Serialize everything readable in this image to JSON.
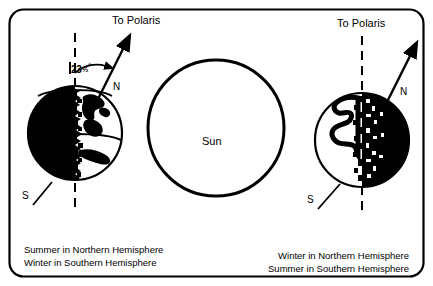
{
  "figure": {
    "kind": "earth-seasons-diagram",
    "background_color": "#ffffff",
    "ink_color": "#000000",
    "border": {
      "name": "rounded-frame",
      "stroke_width": 2,
      "corner_radius": 14
    }
  },
  "sun": {
    "label": "Sun",
    "center_x": 216,
    "center_y": 128,
    "radius": 68,
    "fill": "#ffffff",
    "stroke": "#000000",
    "stroke_width": 3
  },
  "left_earth": {
    "name": "earth-summer-north",
    "center_x": 75,
    "center_y": 133,
    "radius": 47,
    "night_side": "left",
    "polaris_label": "To Polaris",
    "axis_tilt_label_value": "23",
    "axis_tilt_label_fraction": "1/2",
    "axis_tilt_label_degree": "°",
    "north_label": "N",
    "south_label": "S"
  },
  "right_earth": {
    "name": "earth-winter-north",
    "center_x": 362,
    "center_y": 140,
    "radius": 47,
    "night_side": "right",
    "polaris_label": "To Polaris",
    "north_label": "N",
    "south_label": "S"
  },
  "captions": {
    "left": {
      "line1": "Summer in Northern Hemisphere",
      "line2": "Winter in Southern Hemisphere"
    },
    "right": {
      "line1": "Winter in Northern Hemisphere",
      "line2": "Summer in Southern Hemisphere"
    }
  }
}
